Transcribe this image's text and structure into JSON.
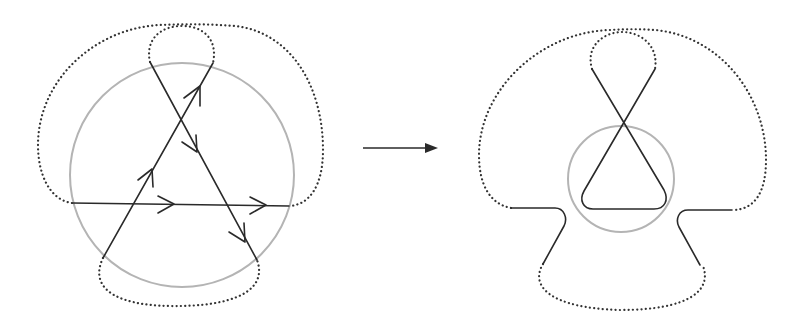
{
  "figure": {
    "colors": {
      "chord": "#2a2a2a",
      "boundary_circle": "#b4b4b4",
      "dotted_arcs": "#333333",
      "background": "#ffffff"
    },
    "left_panel": {
      "label": "",
      "chords": [
        {
          "name": "horizontal-chord",
          "arrows": 2,
          "direction": "left-to-right"
        },
        {
          "name": "descending-chord",
          "arrows": 2,
          "direction": "top-left-to-bottom-right"
        },
        {
          "name": "ascending-chord",
          "arrows": 2,
          "direction": "bottom-left-to-top-right"
        }
      ],
      "dotted_arcs": [
        "top-loop",
        "outer-loop",
        "bottom-loop"
      ]
    },
    "transition_arrow": {
      "label": ""
    },
    "right_panel": {
      "label": "",
      "elements": [
        "crossing-loop",
        "small-circle",
        "side-hooks",
        "dotted-arcs"
      ]
    }
  }
}
